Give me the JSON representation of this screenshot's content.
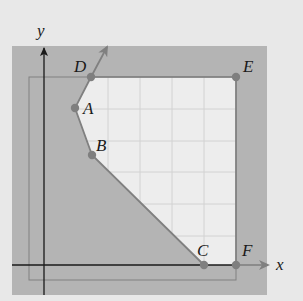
{
  "diagram": {
    "axes": {
      "x_label": "x",
      "y_label": "y"
    },
    "points": [
      {
        "label": "A",
        "px": 75,
        "py": 108
      },
      {
        "label": "B",
        "px": 92,
        "py": 155
      },
      {
        "label": "C",
        "px": 204,
        "py": 265
      },
      {
        "label": "D",
        "px": 91,
        "py": 77
      },
      {
        "label": "E",
        "px": 236,
        "py": 77
      },
      {
        "label": "F",
        "px": 236,
        "py": 265
      }
    ],
    "colors": {
      "background": "#e8e8e8",
      "shaded": "#b4b4b4",
      "feasible": "#ededed",
      "grid": "#d4d4d4",
      "boundary": "#808080",
      "axis": "#1a1a1a"
    }
  }
}
